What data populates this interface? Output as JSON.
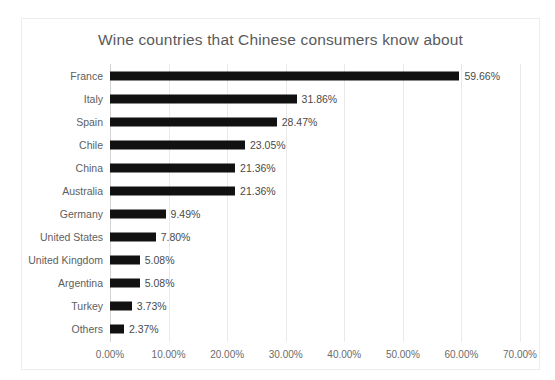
{
  "chart_data": {
    "type": "bar",
    "orientation": "horizontal",
    "title": "Wine countries that Chinese consumers know about",
    "xlabel": "",
    "ylabel": "",
    "xlim": [
      0,
      70
    ],
    "xticks": [
      "0.00%",
      "10.00%",
      "20.00%",
      "30.00%",
      "40.00%",
      "50.00%",
      "60.00%",
      "70.00%"
    ],
    "xtick_values": [
      0,
      10,
      20,
      30,
      40,
      50,
      60,
      70
    ],
    "grid": "vertical",
    "legend": "none",
    "bar_color": "#111111",
    "categories": [
      "France",
      "Italy",
      "Spain",
      "Chile",
      "China",
      "Australia",
      "Germany",
      "United States",
      "United Kingdom",
      "Argentina",
      "Turkey",
      "Others"
    ],
    "values": [
      59.66,
      31.86,
      28.47,
      23.05,
      21.36,
      21.36,
      9.49,
      7.8,
      5.08,
      5.08,
      3.73,
      2.37
    ],
    "data_labels": [
      "59.66%",
      "31.86%",
      "28.47%",
      "23.05%",
      "21.36%",
      "21.36%",
      "9.49%",
      "7.80%",
      "5.08%",
      "5.08%",
      "3.73%",
      "2.37%"
    ]
  }
}
